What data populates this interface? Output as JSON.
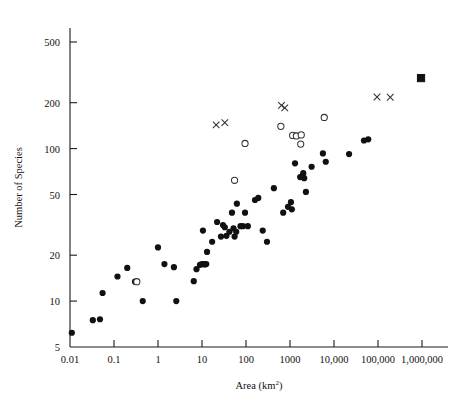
{
  "chart_data": {
    "type": "scatter",
    "title": "",
    "xlabel": "Area (km2)",
    "xlabel_base": "Area (km",
    "xlabel_sup": "2",
    "xlabel_close": ")",
    "ylabel": "Number of Species",
    "xscale": "log",
    "yscale": "log",
    "xlim": [
      0.01,
      1000000
    ],
    "ylim": [
      5,
      700
    ],
    "grid": false,
    "legend": "none",
    "xticks": [
      0.01,
      0.1,
      1,
      10,
      100,
      1000,
      10000,
      100000,
      1000000
    ],
    "xticklabels": [
      "0.01",
      "0.1",
      "1",
      "10",
      "100",
      "1000",
      "10,000",
      "100,000",
      "1,000,000"
    ],
    "yticks": [
      5,
      10,
      20,
      50,
      100,
      200,
      500
    ],
    "yticklabels": [
      "5",
      "10",
      "20",
      "50",
      "100",
      "200",
      "500"
    ],
    "series": [
      {
        "name": "filled-circle",
        "marker": "filled-circle",
        "points": [
          [
            0.011,
            6.2
          ],
          [
            0.033,
            7.5
          ],
          [
            0.048,
            7.6
          ],
          [
            0.055,
            11.3
          ],
          [
            0.12,
            14.5
          ],
          [
            0.2,
            16.5
          ],
          [
            0.3,
            13.4
          ],
          [
            0.45,
            10.0
          ],
          [
            1.0,
            22.5
          ],
          [
            1.4,
            17.5
          ],
          [
            2.3,
            16.7
          ],
          [
            2.6,
            10.0
          ],
          [
            6.5,
            13.5
          ],
          [
            7.5,
            16.2
          ],
          [
            9.0,
            17.3
          ],
          [
            10.0,
            17.5
          ],
          [
            11.0,
            17.5
          ],
          [
            11.5,
            17.4
          ],
          [
            12.5,
            17.5
          ],
          [
            10.5,
            29.0
          ],
          [
            13.0,
            21.0
          ],
          [
            17.0,
            24.5
          ],
          [
            22.0,
            33.0
          ],
          [
            27.0,
            26.5
          ],
          [
            30.0,
            31.5
          ],
          [
            33.0,
            30.5
          ],
          [
            36.0,
            26.8
          ],
          [
            42.0,
            28.5
          ],
          [
            48.0,
            38.0
          ],
          [
            52.0,
            30.0
          ],
          [
            55.0,
            26.5
          ],
          [
            60.0,
            28.5
          ],
          [
            62.0,
            43.5
          ],
          [
            75.0,
            31.0
          ],
          [
            85.0,
            31.0
          ],
          [
            95.0,
            38.0
          ],
          [
            110.0,
            31.0
          ],
          [
            160.0,
            46.0
          ],
          [
            190.0,
            47.5
          ],
          [
            240.0,
            29.0
          ],
          [
            300.0,
            24.5
          ],
          [
            430.0,
            55.0
          ],
          [
            700.0,
            38.0
          ],
          [
            900.0,
            41.5
          ],
          [
            1050.0,
            44.5
          ],
          [
            1100.0,
            40.0
          ],
          [
            1300.0,
            80.0
          ],
          [
            1700.0,
            65.0
          ],
          [
            1900.0,
            66.0
          ],
          [
            2000.0,
            69.0
          ],
          [
            2100.0,
            64.0
          ],
          [
            2300.0,
            52.0
          ],
          [
            3100.0,
            76.0
          ],
          [
            5600.0,
            93.0
          ],
          [
            6500.0,
            82.0
          ],
          [
            22000.0,
            92.0
          ],
          [
            48000.0,
            113.0
          ],
          [
            60000.0,
            115.0
          ]
        ]
      },
      {
        "name": "open-circle",
        "marker": "open-circle",
        "points": [
          [
            0.33,
            13.4
          ],
          [
            55.0,
            62.0
          ],
          [
            95.0,
            108.0
          ],
          [
            620.0,
            140.0
          ],
          [
            1150.0,
            122.0
          ],
          [
            1400.0,
            121.0
          ],
          [
            1800.0,
            123.0
          ],
          [
            1750.0,
            107.0
          ],
          [
            6000.0,
            160.0
          ]
        ]
      },
      {
        "name": "cross",
        "marker": "cross",
        "points": [
          [
            21.0,
            143.0
          ],
          [
            33.0,
            148.0
          ],
          [
            640.0,
            192.0
          ],
          [
            760.0,
            185.0
          ],
          [
            95000.0,
            218.0
          ],
          [
            190000.0,
            217.0
          ]
        ]
      },
      {
        "name": "square",
        "marker": "square",
        "points": [
          [
            950000.0,
            290.0
          ]
        ]
      }
    ]
  }
}
